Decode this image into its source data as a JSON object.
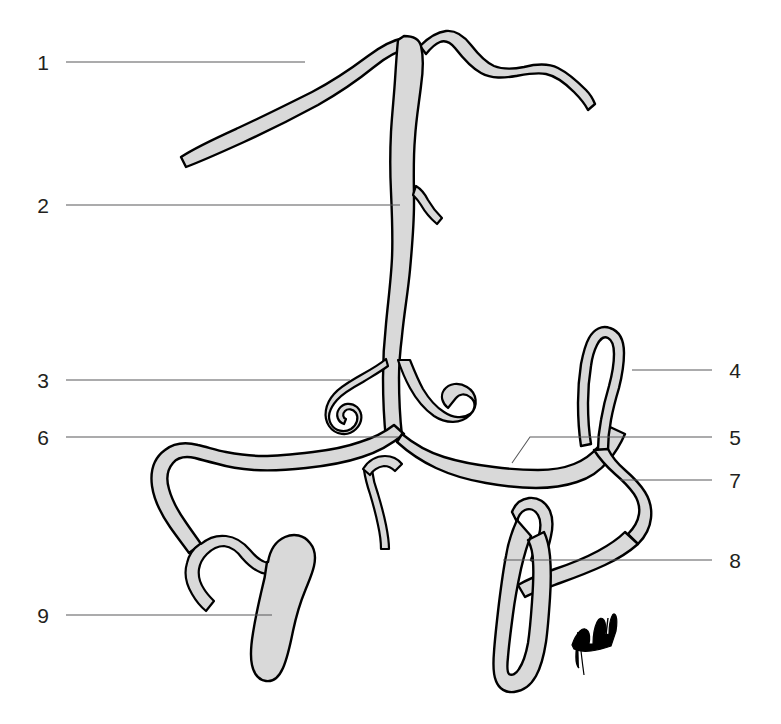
{
  "figure": {
    "type": "anatomical-line-drawing",
    "title": "",
    "background_color": "#ffffff",
    "fill_color": "#d9d9d9",
    "outline_color": "#000000",
    "leader_color": "#58595b",
    "label_color": "#231f20",
    "signature": "artist-signature-mark"
  },
  "labels": {
    "left": [
      {
        "id": "label-1",
        "number": "1",
        "x": 43,
        "y": 70,
        "line_x1": 66,
        "line_y1": 62,
        "line_x2": 305,
        "line_y2": 62
      },
      {
        "id": "label-2",
        "number": "2",
        "x": 43,
        "y": 213,
        "line_x1": 66,
        "line_y1": 205,
        "line_x2": 400,
        "line_y2": 205
      },
      {
        "id": "label-3",
        "number": "3",
        "x": 43,
        "y": 388,
        "line_x1": 66,
        "line_y1": 380,
        "line_x2": 350,
        "line_y2": 380
      },
      {
        "id": "label-6",
        "number": "6",
        "x": 43,
        "y": 445,
        "line_x1": 66,
        "line_y1": 437,
        "line_x2": 398,
        "line_y2": 437
      },
      {
        "id": "label-9",
        "number": "9",
        "x": 43,
        "y": 623,
        "line_x1": 66,
        "line_y1": 615,
        "line_x2": 272,
        "line_y2": 615
      }
    ],
    "right": [
      {
        "id": "label-4",
        "number": "4",
        "x": 729,
        "y": 378,
        "line_x1": 712,
        "line_y1": 370,
        "line_x2": 632,
        "line_y2": 370
      },
      {
        "id": "label-5",
        "number": "5",
        "x": 729,
        "y": 445,
        "line_x1": 712,
        "line_y1": 437,
        "line_x2": 570,
        "line_y2": 437
      },
      {
        "id": "label-7",
        "number": "7",
        "x": 729,
        "y": 488,
        "line_x1": 712,
        "line_y1": 480,
        "line_x2": 620,
        "line_y2": 480
      },
      {
        "id": "label-8",
        "number": "8",
        "x": 729,
        "y": 568,
        "line_x1": 712,
        "line_y1": 560,
        "line_x2": 503,
        "line_y2": 560
      }
    ]
  },
  "leader_elbow_5": {
    "description": "leader for label 5 bends down-left into the structure",
    "points": "570,437 530,437 512,463"
  }
}
